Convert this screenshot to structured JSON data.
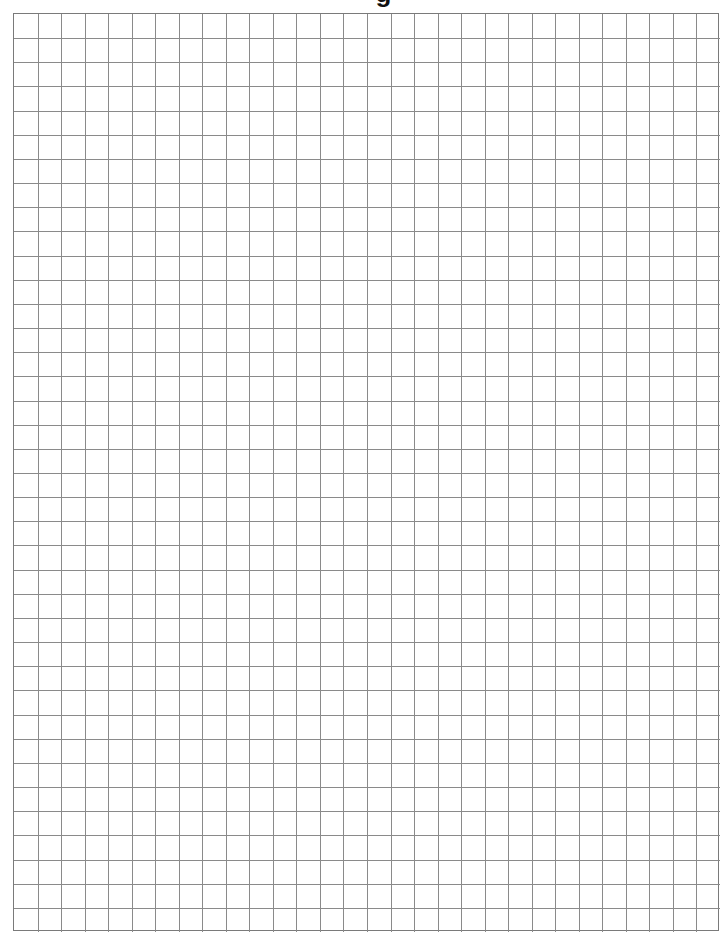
{
  "page": {
    "title_fragment": "g",
    "grid": {
      "columns": 30,
      "rows": 38,
      "line_color": "#8a8a8a",
      "border_color": "#7a7a7a",
      "background": "#ffffff"
    }
  }
}
